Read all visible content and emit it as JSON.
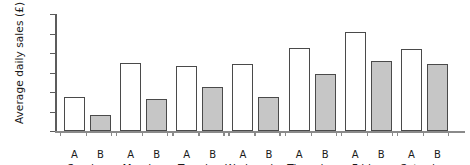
{
  "chart_data": {
    "type": "bar",
    "title": "",
    "xlabel": "",
    "ylabel": "Average daily sales (£)",
    "ylim": [
      0,
      300
    ],
    "yticks": [
      0,
      50,
      100,
      150,
      200,
      250,
      300
    ],
    "ytick_labels": [
      "0",
      "50",
      "100",
      "150",
      "200",
      "250",
      "300"
    ],
    "grid": false,
    "legend": "none",
    "categories": [
      "Sunday",
      "Monday",
      "Tuesday",
      "Wednesday",
      "Thursday",
      "Friday",
      "Saturday"
    ],
    "subcategory_labels": [
      "A",
      "B"
    ],
    "series": [
      {
        "name": "A",
        "color": "#ffffff",
        "values": [
          88,
          175,
          167,
          172,
          213,
          255,
          211
        ]
      },
      {
        "name": "B",
        "color": "#c6c6c6",
        "values": [
          42,
          82,
          113,
          87,
          146,
          180,
          172
        ]
      }
    ]
  },
  "axis": {
    "y_title": "Average daily sales (£)",
    "outline_color": "#4a4a4a",
    "axis_color": "#5c5c5c"
  }
}
